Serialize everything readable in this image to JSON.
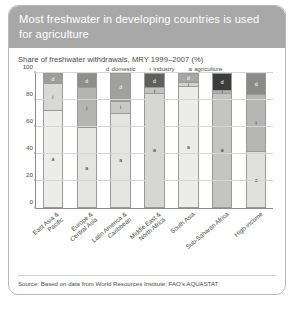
{
  "header": {
    "title": "Most freshwater in developing countries is used for agriculture",
    "bg_color": "#a8a8a8"
  },
  "subtitle": "Share of freshwater withdrawals, MRY 1999–2007 (%)",
  "legend": [
    {
      "key": "d",
      "label": "domestic"
    },
    {
      "key": "i",
      "label": "industry"
    },
    {
      "key": "a",
      "label": "agriculture"
    }
  ],
  "source": "Source: Based on data from World Resources Institute; FAO's AQUASTAT",
  "chart_data": {
    "type": "bar",
    "title": "Most freshwater in developing countries is used for agriculture",
    "subtitle": "Share of freshwater withdrawals, MRY 1999–2007 (%)",
    "stacked": true,
    "xlabel": "",
    "ylabel": "",
    "ylim": [
      0,
      100
    ],
    "yticks": [
      0,
      20,
      40,
      60,
      80,
      100
    ],
    "grid": true,
    "legend_position": "top",
    "categories": [
      "East Asia & Pacific",
      "Europe & Central Asia",
      "Latin America & Caribbean",
      "Middle East & North Africa",
      "South Asia",
      "Sub-Saharan Africa",
      "High-income"
    ],
    "series": [
      {
        "name": "agriculture",
        "key": "a",
        "color": "#e6e6e0",
        "values": [
          73,
          60,
          71,
          86,
          91,
          86,
          42
        ]
      },
      {
        "name": "industry",
        "key": "i",
        "color": "#bdbdbd",
        "values": [
          20,
          30,
          9,
          4,
          3,
          2,
          43
        ]
      },
      {
        "name": "domestic",
        "key": "d",
        "color": "#8a8a8a",
        "values": [
          7,
          10,
          20,
          10,
          6,
          12,
          15
        ]
      }
    ],
    "bar_colors": [
      {
        "agriculture": "#ececeb",
        "industry": "#d8d8d6",
        "domestic": "#9d9d9b"
      },
      {
        "agriculture": "#e4e4e0",
        "industry": "#b4b4b2",
        "domestic": "#8e8e8c"
      },
      {
        "agriculture": "#e4e4e2",
        "industry": "#c8c8c6",
        "domestic": "#a0a09e"
      },
      {
        "agriculture": "#d6d6d2",
        "industry": "#c2c2c0",
        "domestic": "#5f5f5d"
      },
      {
        "agriculture": "#ececea",
        "industry": "#d2d2d0",
        "domestic": "#a6a6a4"
      },
      {
        "agriculture": "#c4c4c2",
        "industry": "#b0b0ae",
        "domestic": "#3c3c3a"
      },
      {
        "agriculture": "#e0e0dc",
        "industry": "#b6b6b4",
        "domestic": "#8a8a88"
      }
    ]
  }
}
